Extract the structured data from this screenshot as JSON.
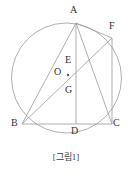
{
  "figure": {
    "caption": "[그림1]",
    "stroke_color": "#9a9a9a",
    "label_color": "#333333",
    "background_color": "#ffffff",
    "circle": {
      "cx": 66.5,
      "cy": 78,
      "r": 55
    },
    "points": [
      {
        "id": "A",
        "label": "A",
        "x": 76,
        "y": 23,
        "label_x": 72,
        "label_y": 9
      },
      {
        "id": "F",
        "label": "F",
        "x": 112,
        "y": 38,
        "label_x": 110,
        "label_y": 25
      },
      {
        "id": "E",
        "label": "E",
        "x": 76,
        "y": 68,
        "label_x": 66,
        "label_y": 58
      },
      {
        "id": "O",
        "label": "O",
        "x": 66.5,
        "y": 78,
        "label_x": 55,
        "label_y": 70
      },
      {
        "id": "G",
        "label": "G",
        "x": 76,
        "y": 98,
        "label_x": 66,
        "label_y": 87
      },
      {
        "id": "B",
        "label": "B",
        "x": 22,
        "y": 124,
        "label_x": 12,
        "label_y": 121
      },
      {
        "id": "D",
        "label": "D",
        "x": 76,
        "y": 124,
        "label_x": 72,
        "label_y": 127
      },
      {
        "id": "C",
        "label": "C",
        "x": 112,
        "y": 124,
        "label_x": 113,
        "label_y": 121
      }
    ],
    "segments": [
      {
        "name": "segment-AB",
        "from": "A",
        "to": "B"
      },
      {
        "name": "segment-AD",
        "from": "A",
        "to": "D"
      },
      {
        "name": "segment-AC",
        "from": "A",
        "to": "C"
      },
      {
        "name": "segment-BC",
        "from": "B",
        "to": "C"
      },
      {
        "name": "segment-BF",
        "from": "B",
        "to": "F"
      },
      {
        "name": "segment-FC",
        "from": "F",
        "to": "C"
      },
      {
        "name": "segment-AF",
        "from": "A",
        "to": "F"
      }
    ],
    "center_dot": {
      "x": 68,
      "y": 75,
      "r": 1.2
    }
  }
}
